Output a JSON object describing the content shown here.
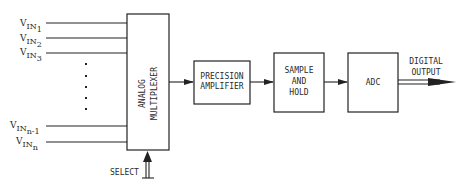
{
  "diagram": {
    "type": "block-diagram",
    "inputs": [
      {
        "base": "V",
        "sub1": "IN",
        "sub2": "1"
      },
      {
        "base": "V",
        "sub1": "IN",
        "sub2": "2"
      },
      {
        "base": "V",
        "sub1": "IN",
        "sub2": "3"
      },
      {
        "base": "V",
        "sub1": "IN",
        "sub2": "n-1"
      },
      {
        "base": "V",
        "sub1": "IN",
        "sub2": "n"
      }
    ],
    "blocks": {
      "mux": {
        "line1": "ANALOG",
        "line2": "MULTIPLEXER"
      },
      "amp": {
        "line1": "PRECISION",
        "line2": "AMPLIFIER"
      },
      "sh": {
        "line1": "SAMPLE",
        "line2": "AND",
        "line3": "HOLD"
      },
      "adc": {
        "line1": "ADC"
      }
    },
    "select_label": "SELECT",
    "output": {
      "line1": "DIGITAL",
      "line2": "OUTPUT"
    },
    "colors": {
      "line": "#222222",
      "background": "#ffffff"
    }
  }
}
